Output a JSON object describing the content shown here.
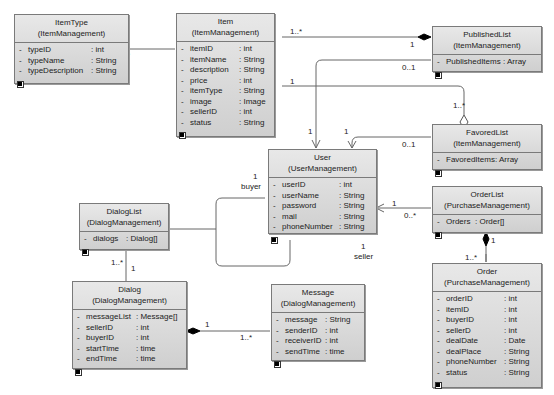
{
  "classes": {
    "itemtype": {
      "name": "ItemType",
      "package": "(ItemManagement)",
      "attrs": [
        {
          "vis": "-",
          "name": "typeID",
          "type": ": int"
        },
        {
          "vis": "-",
          "name": "typeName",
          "type": ": String"
        },
        {
          "vis": "-",
          "name": "typeDescription",
          "type": ": String"
        }
      ]
    },
    "item": {
      "name": "Item",
      "package": "(ItemManagement)",
      "attrs": [
        {
          "vis": "-",
          "name": "itemID",
          "type": ": int"
        },
        {
          "vis": "-",
          "name": "itemName",
          "type": ": String"
        },
        {
          "vis": "-",
          "name": "description",
          "type": ": String"
        },
        {
          "vis": "-",
          "name": "price",
          "type": ": int"
        },
        {
          "vis": "-",
          "name": "itemType",
          "type": ": String"
        },
        {
          "vis": "-",
          "name": "image",
          "type": ": Image"
        },
        {
          "vis": "-",
          "name": "sellerID",
          "type": ": int"
        },
        {
          "vis": "-",
          "name": "status",
          "type": ": String"
        }
      ]
    },
    "publishedlist": {
      "name": "PublishedList",
      "package": "(ItemManagement)",
      "attrs": [
        {
          "vis": "-",
          "name": "PublishedItems",
          "type": ": Array"
        }
      ]
    },
    "favoredlist": {
      "name": "FavoredList",
      "package": "(ItemManagement)",
      "attrs": [
        {
          "vis": "-",
          "name": "FavoredItems",
          "type": ": Array"
        }
      ]
    },
    "user": {
      "name": "User",
      "package": "(UserManagement)",
      "attrs": [
        {
          "vis": "-",
          "name": "userID",
          "type": ": int"
        },
        {
          "vis": "-",
          "name": "userName",
          "type": ": String"
        },
        {
          "vis": "-",
          "name": "password",
          "type": ": String"
        },
        {
          "vis": "-",
          "name": "mail",
          "type": ": String"
        },
        {
          "vis": "-",
          "name": "phoneNumber",
          "type": ": String"
        }
      ]
    },
    "orderlist": {
      "name": "OrderList",
      "package": "(PurchaseManagement)",
      "attrs": [
        {
          "vis": "-",
          "name": "Orders",
          "type": ": Order[]"
        }
      ]
    },
    "order": {
      "name": "Order",
      "package": "(PurchaseManagement)",
      "attrs": [
        {
          "vis": "-",
          "name": "orderID",
          "type": ": int"
        },
        {
          "vis": "-",
          "name": "itemID",
          "type": ": int"
        },
        {
          "vis": "-",
          "name": "buyerID",
          "type": ": int"
        },
        {
          "vis": "-",
          "name": "sellerD",
          "type": ": int"
        },
        {
          "vis": "-",
          "name": "dealDate",
          "type": ": Date"
        },
        {
          "vis": "-",
          "name": "dealPlace",
          "type": ": String"
        },
        {
          "vis": "-",
          "name": "phoneNumber",
          "type": ": String"
        },
        {
          "vis": "-",
          "name": "status",
          "type": ": String"
        }
      ]
    },
    "dialoglist": {
      "name": "DialogList",
      "package": "(DialogManagement)",
      "attrs": [
        {
          "vis": "-",
          "name": "dialogs",
          "type": ": Dialog[]"
        }
      ]
    },
    "dialog": {
      "name": "Dialog",
      "package": "(DialogManagement)",
      "attrs": [
        {
          "vis": "-",
          "name": "messageList",
          "type": ": Message[]"
        },
        {
          "vis": "-",
          "name": "sellerID",
          "type": ": int"
        },
        {
          "vis": "-",
          "name": "buyerID",
          "type": ": int"
        },
        {
          "vis": "-",
          "name": "startTime",
          "type": ": time"
        },
        {
          "vis": "-",
          "name": "endTime",
          "type": ": time"
        }
      ]
    },
    "message": {
      "name": "Message",
      "package": "(DialogManagement)",
      "attrs": [
        {
          "vis": "-",
          "name": "message",
          "type": ": String"
        },
        {
          "vis": "-",
          "name": "senderID",
          "type": ": int"
        },
        {
          "vis": "-",
          "name": "receiverID",
          "type": ": int"
        },
        {
          "vis": "-",
          "name": "sendTime",
          "type": ": time"
        }
      ]
    }
  },
  "multiplicities": {
    "item_itemtype_near_item": "1..*",
    "item_itemtype_near_type": "1",
    "item_published_near_item": "1..*",
    "item_published_near_list": "1",
    "user_published_near_list": "0..1",
    "user_published_near_user": "1",
    "item_favored_near_item": "1",
    "item_favored_near_list": "1..*",
    "user_favored_near_list": "0..1",
    "user_favored_near_user": "1",
    "user_orderlist_near_user": "1",
    "user_orderlist_near_list": "0..*",
    "orderlist_order_near_list": "1",
    "orderlist_order_near_order": "1..*",
    "user_dialoglist_buyer_mult": "1",
    "user_dialoglist_buyer_role": "buyer",
    "user_dialoglist_seller_mult": "1",
    "user_dialoglist_seller_role": "seller",
    "dialoglist_dialog_near_dialog": "1..*",
    "dialoglist_dialog_near_list": "1",
    "dialog_message_near_dialog": "1",
    "dialog_message_near_message": "1..*"
  }
}
